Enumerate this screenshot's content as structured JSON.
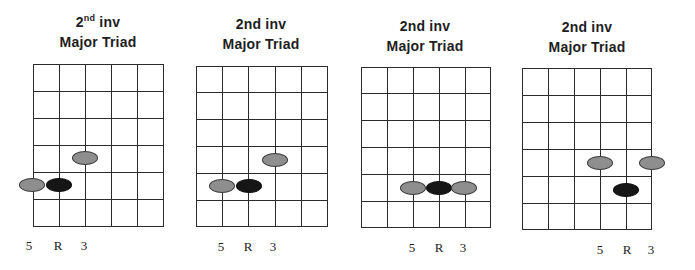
{
  "colors": {
    "grid": "#2b2b2b",
    "interval_dot": "#8e8e8e",
    "root_dot": "#161616"
  },
  "diagrams": [
    {
      "title_line1_main": "2",
      "title_line1_sup": "nd",
      "title_line1_rest": " inv",
      "title_line2": "Major Triad",
      "title_x": 18,
      "title_y": 12,
      "grid": {
        "left": 33,
        "top": 64,
        "width": 131,
        "height": 163,
        "cols": 5,
        "rows": 6
      },
      "dots": [
        {
          "x": 85,
          "y": 158,
          "type": "gray",
          "interval": "3"
        },
        {
          "x": 32,
          "y": 185,
          "type": "gray",
          "interval": "5"
        },
        {
          "x": 59,
          "y": 185,
          "type": "black",
          "interval": "R"
        }
      ],
      "labels": [
        {
          "text": "5",
          "x": 29,
          "y": 238
        },
        {
          "text": "R",
          "x": 58,
          "y": 238
        },
        {
          "text": "3",
          "x": 84,
          "y": 238
        }
      ]
    },
    {
      "title_line1_main": "2nd inv",
      "title_line1_sup": "",
      "title_line1_rest": "",
      "title_line2": "Major Triad",
      "title_x": 181,
      "title_y": 14,
      "grid": {
        "left": 196,
        "top": 66,
        "width": 132,
        "height": 161,
        "cols": 5,
        "rows": 6
      },
      "dots": [
        {
          "x": 275,
          "y": 160,
          "type": "gray",
          "interval": "3"
        },
        {
          "x": 222,
          "y": 186,
          "type": "gray",
          "interval": "5"
        },
        {
          "x": 249,
          "y": 186,
          "type": "black",
          "interval": "R"
        }
      ],
      "labels": [
        {
          "text": "5",
          "x": 221,
          "y": 239
        },
        {
          "text": "R",
          "x": 248,
          "y": 239
        },
        {
          "text": "3",
          "x": 273,
          "y": 239
        }
      ]
    },
    {
      "title_line1_main": "2nd inv",
      "title_line1_sup": "",
      "title_line1_rest": "",
      "title_line2": "Major Triad",
      "title_x": 345,
      "title_y": 16,
      "grid": {
        "left": 361,
        "top": 67,
        "width": 130,
        "height": 161,
        "cols": 5,
        "rows": 6
      },
      "dots": [
        {
          "x": 413,
          "y": 188,
          "type": "gray",
          "interval": "5"
        },
        {
          "x": 439,
          "y": 188,
          "type": "black",
          "interval": "R"
        },
        {
          "x": 464,
          "y": 188,
          "type": "gray",
          "interval": "3"
        }
      ],
      "labels": [
        {
          "text": "5",
          "x": 412,
          "y": 240
        },
        {
          "text": "R",
          "x": 439,
          "y": 240
        },
        {
          "text": "3",
          "x": 463,
          "y": 240
        }
      ]
    },
    {
      "title_line1_main": "2nd inv",
      "title_line1_sup": "",
      "title_line1_rest": "",
      "title_line2": "Major Triad",
      "title_x": 507,
      "title_y": 17,
      "grid": {
        "left": 522,
        "top": 68,
        "width": 130,
        "height": 162,
        "cols": 5,
        "rows": 6
      },
      "dots": [
        {
          "x": 600,
          "y": 163,
          "type": "gray",
          "interval": "5"
        },
        {
          "x": 652,
          "y": 163,
          "type": "gray",
          "interval": "3"
        },
        {
          "x": 626,
          "y": 190,
          "type": "black",
          "interval": "R"
        }
      ],
      "labels": [
        {
          "text": "5",
          "x": 600,
          "y": 242
        },
        {
          "text": "R",
          "x": 627,
          "y": 242
        },
        {
          "text": "3",
          "x": 651,
          "y": 242
        }
      ]
    }
  ]
}
